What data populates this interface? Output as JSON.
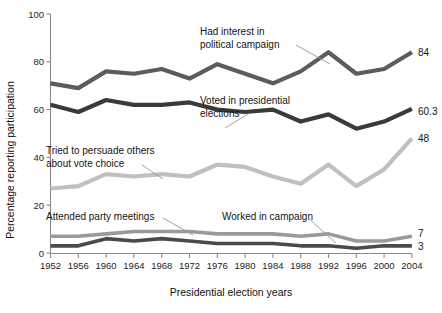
{
  "chart_data": {
    "type": "line",
    "title": "",
    "xlabel": "Presidential election years",
    "ylabel": "Percentage reporting participation",
    "ylim": [
      0,
      100
    ],
    "yticks": [
      0,
      20,
      40,
      60,
      80,
      100
    ],
    "grid": false,
    "legend": "annotations-inline",
    "categories": [
      "1952",
      "1956",
      "1960",
      "1964",
      "1968",
      "1972",
      "1976",
      "1980",
      "1984",
      "1988",
      "1992",
      "1996",
      "2000",
      "2004"
    ],
    "series": [
      {
        "name": "Had interest in political campaign",
        "color": "#5c5c5c",
        "end_label": "84",
        "values": [
          71,
          69,
          76,
          75,
          77,
          73,
          79,
          75,
          71,
          76,
          84,
          75,
          77,
          84
        ]
      },
      {
        "name": "Voted in presidential elections",
        "color": "#3a3a3a",
        "end_label": "60.3",
        "values": [
          62,
          59,
          64,
          62,
          62,
          63,
          60,
          59,
          60,
          55,
          58,
          52,
          55,
          60.3
        ]
      },
      {
        "name": "Tried to persuade others about vote choice",
        "color": "#c0c0c0",
        "end_label": "48",
        "values": [
          27,
          28,
          33,
          32,
          33,
          32,
          37,
          36,
          32,
          29,
          37,
          28,
          35,
          48
        ]
      },
      {
        "name": "Attended party meetings",
        "color": "#9a9a9a",
        "end_label": "7",
        "values": [
          7,
          7,
          8,
          9,
          9,
          9,
          8,
          8,
          8,
          7,
          8,
          5,
          5,
          7
        ]
      },
      {
        "name": "Worked in campaign",
        "color": "#4a4a4a",
        "end_label": "3",
        "values": [
          3,
          3,
          6,
          5,
          6,
          5,
          4,
          4,
          4,
          3,
          3,
          2,
          3,
          3
        ]
      }
    ],
    "annotations": [
      {
        "id": "interest",
        "lines": [
          "Had interest in",
          "political campaign"
        ]
      },
      {
        "id": "voted",
        "lines": [
          "Voted in presidential",
          "elections"
        ]
      },
      {
        "id": "persuade",
        "lines": [
          "Tried to persuade others",
          "about vote choice"
        ]
      },
      {
        "id": "meetings",
        "lines": [
          "Attended party meetings"
        ]
      },
      {
        "id": "worked",
        "lines": [
          "Worked in campaign"
        ]
      }
    ]
  }
}
